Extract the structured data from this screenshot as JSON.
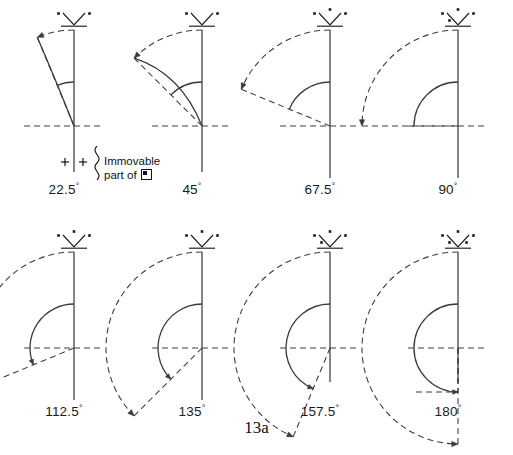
{
  "figure": {
    "caption": "13a",
    "annotation_line1": "Immovable",
    "annotation_line2": "part of",
    "annotation_symbol_name": "square-in-square-symbol",
    "degree_symbol": "°",
    "stroke_color": "#3a3a46",
    "text_color": "#111111",
    "background": "#ffffff"
  },
  "panels": [
    {
      "id": "panel-22-5",
      "angle_label": "22.5",
      "angle_deg": 22.5,
      "icon_name": "v-marker-icon",
      "icon_dots": 2,
      "has_ground_markers": true,
      "ground_marker_label": "+|+",
      "has_annotation": true
    },
    {
      "id": "panel-45",
      "angle_label": "45",
      "angle_deg": 45,
      "icon_name": "v-marker-icon",
      "icon_dots": 2,
      "has_ground_markers": false,
      "has_annotation": false
    },
    {
      "id": "panel-67-5",
      "angle_label": "67.5",
      "angle_deg": 67.5,
      "icon_name": "v-marker-icon",
      "icon_dots": 3,
      "has_ground_markers": false,
      "has_annotation": false
    },
    {
      "id": "panel-90",
      "angle_label": "90",
      "angle_deg": 90,
      "icon_name": "v-marker-icon",
      "icon_dots": 4,
      "has_ground_markers": false,
      "has_annotation": false
    },
    {
      "id": "panel-112-5",
      "angle_label": "112.5",
      "angle_deg": 112.5,
      "icon_name": "v-marker-icon",
      "icon_dots": 3,
      "has_ground_markers": false,
      "has_annotation": false
    },
    {
      "id": "panel-135",
      "angle_label": "135",
      "angle_deg": 135,
      "icon_name": "v-marker-icon",
      "icon_dots": 3,
      "has_ground_markers": false,
      "has_annotation": false
    },
    {
      "id": "panel-157-5",
      "angle_label": "157.5",
      "angle_deg": 157.5,
      "icon_name": "v-marker-icon",
      "icon_dots": 4,
      "has_ground_markers": false,
      "has_annotation": false
    },
    {
      "id": "panel-180",
      "angle_label": "180",
      "angle_deg": 180,
      "icon_name": "v-marker-icon",
      "icon_dots": 5,
      "has_ground_markers": false,
      "has_annotation": false
    }
  ]
}
